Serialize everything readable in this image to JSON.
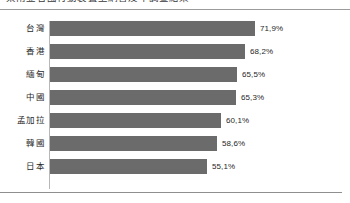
{
  "header": {
    "title_clipped": "東南亞各國行動裝置上網普及率調查結果",
    "rule_color": "#9b9b9b"
  },
  "chart_data": {
    "type": "bar",
    "orientation": "horizontal",
    "title": "",
    "xlabel": "",
    "ylabel": "",
    "xlim": [
      0,
      75
    ],
    "grid": false,
    "legend": false,
    "bar_color": "#6b6b6b",
    "value_suffix": "%",
    "categories": [
      "台灣",
      "香港",
      "緬甸",
      "中國",
      "孟加拉",
      "韓國",
      "日本"
    ],
    "values": [
      71.9,
      68.2,
      65.5,
      65.3,
      60.1,
      58.6,
      55.1
    ],
    "value_labels": [
      "71,9%",
      "68,2%",
      "65,5%",
      "65,3%",
      "60,1%",
      "58,6%",
      "55,1%"
    ],
    "rows": [
      {
        "label": "台灣",
        "value": 71.9,
        "value_label": "71,9%"
      },
      {
        "label": "香港",
        "value": 68.2,
        "value_label": "68,2%"
      },
      {
        "label": "緬甸",
        "value": 65.5,
        "value_label": "65,5%"
      },
      {
        "label": "中國",
        "value": 65.3,
        "value_label": "65,3%"
      },
      {
        "label": "孟加拉",
        "value": 60.1,
        "value_label": "60,1%"
      },
      {
        "label": "韓國",
        "value": 58.6,
        "value_label": "58,6%"
      },
      {
        "label": "日本",
        "value": 55.1,
        "value_label": "55,1%"
      }
    ]
  }
}
